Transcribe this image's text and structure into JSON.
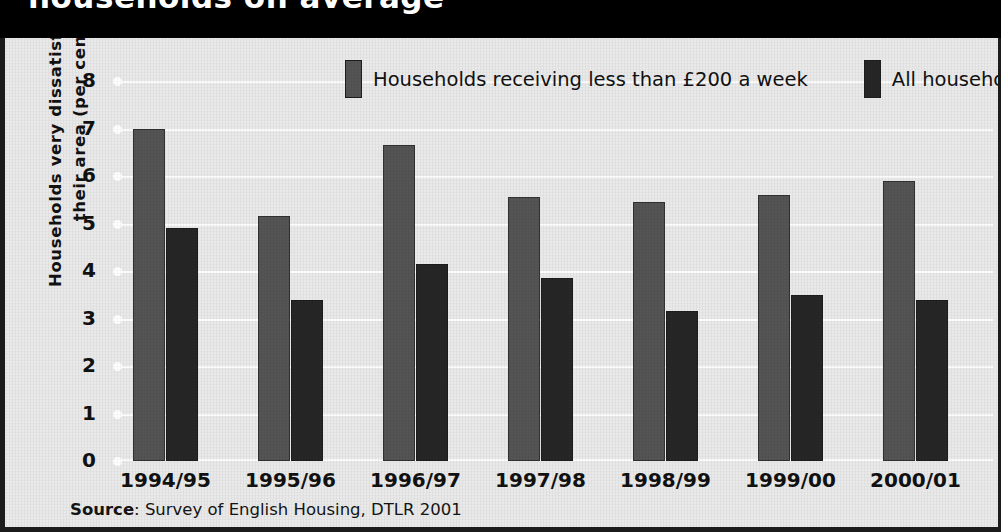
{
  "title": {
    "text": "households on average"
  },
  "legend": {
    "position": "top",
    "items": [
      {
        "label": "Households receiving less than £200 a week",
        "color": "#545454",
        "name": "low-income-households"
      },
      {
        "label": "All households",
        "color": "#262626",
        "name": "all-households"
      }
    ]
  },
  "source": {
    "prefix": "Source",
    "text": ": Survey of English Housing, DTLR 2001"
  },
  "axes": {
    "ylabel_line1": "Households very dissatisfied with",
    "ylabel_line2": "their area (per cent)",
    "yticks": [
      "0",
      "1",
      "2",
      "3",
      "4",
      "5",
      "6",
      "7",
      "8"
    ]
  },
  "chart_data": {
    "type": "bar",
    "title": "households on average",
    "xlabel": "",
    "ylabel": "Households very dissatisfied with their area (per cent)",
    "ylim": [
      0,
      8
    ],
    "ytick_values": [
      0,
      1,
      2,
      3,
      4,
      5,
      6,
      7,
      8
    ],
    "grid": true,
    "legend_position": "top",
    "categories": [
      "1994/95",
      "1995/96",
      "1996/97",
      "1997/98",
      "1998/99",
      "1999/00",
      "2000/01"
    ],
    "series": [
      {
        "name": "Households receiving less than £200 a week",
        "color": "#545454",
        "values": [
          7.0,
          5.15,
          6.65,
          5.55,
          5.45,
          5.6,
          5.9
        ]
      },
      {
        "name": "All households",
        "color": "#262626",
        "values": [
          4.9,
          3.4,
          4.15,
          3.85,
          3.15,
          3.5,
          3.4
        ]
      }
    ]
  }
}
